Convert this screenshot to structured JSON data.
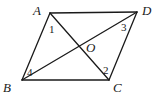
{
  "figure": {
    "type": "parallelogram-with-diagonals",
    "vertices": [
      {
        "name": "A",
        "x": 50,
        "y": 13,
        "label_x": 33,
        "label_y": 15
      },
      {
        "name": "D",
        "x": 137,
        "y": 12,
        "label_x": 142,
        "label_y": 15
      },
      {
        "name": "C",
        "x": 109,
        "y": 80,
        "label_x": 113,
        "label_y": 92
      },
      {
        "name": "B",
        "x": 22,
        "y": 80,
        "label_x": 3,
        "label_y": 92
      }
    ],
    "center": {
      "name": "O",
      "x": 80,
      "y": 46,
      "label_x": 86,
      "label_y": 52
    },
    "angle_labels": [
      {
        "text": "1",
        "x": 49,
        "y": 33
      },
      {
        "text": "3",
        "x": 121,
        "y": 31
      },
      {
        "text": "4",
        "x": 27,
        "y": 76
      },
      {
        "text": "2",
        "x": 103,
        "y": 74
      }
    ],
    "labels": {
      "A": "A",
      "B": "B",
      "C": "C",
      "D": "D",
      "O": "O",
      "angle1": "1",
      "angle2": "2",
      "angle3": "3",
      "angle4": "4"
    },
    "stroke_color": "#1a1a1a",
    "background": "#ffffff"
  }
}
